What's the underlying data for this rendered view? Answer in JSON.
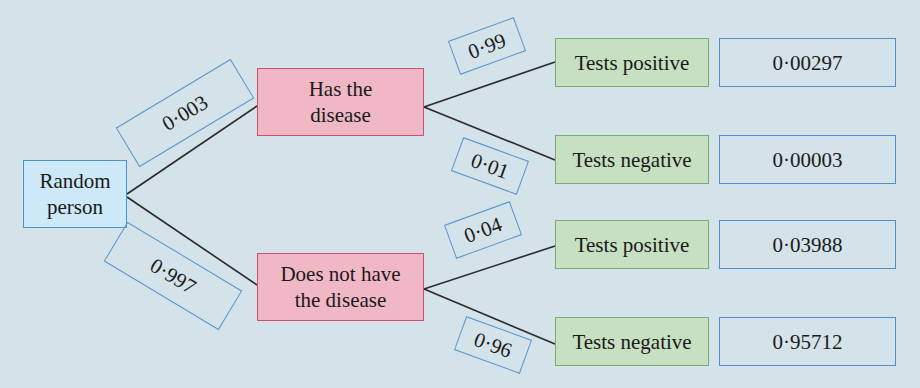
{
  "diagram": {
    "type": "probability-tree",
    "root": {
      "label_line1": "Random",
      "label_line2": "person"
    },
    "level1": [
      {
        "label_line1": "Has the",
        "label_line2": "disease",
        "probability": "0·003"
      },
      {
        "label_line1": "Does not have",
        "label_line2": "the disease",
        "probability": "0·997"
      }
    ],
    "level2": [
      {
        "parent": 0,
        "label": "Tests positive",
        "probability": "0·99",
        "joint_probability": "0·00297"
      },
      {
        "parent": 0,
        "label": "Tests negative",
        "probability": "0·01",
        "joint_probability": "0·00003"
      },
      {
        "parent": 1,
        "label": "Tests positive",
        "probability": "0·04",
        "joint_probability": "0·03988"
      },
      {
        "parent": 1,
        "label": "Tests negative",
        "probability": "0·96",
        "joint_probability": "0·95712"
      }
    ],
    "colors": {
      "background": "#d4e2e9",
      "root_fill": "#cde8f6",
      "root_border": "#4d93c9",
      "condition_fill": "#f0b7c5",
      "condition_border": "#cf4f6d",
      "test_fill": "#c6e0c1",
      "test_border": "#7aad76",
      "result_border": "#4d8fce",
      "branch_line": "#2a2a2a"
    }
  }
}
